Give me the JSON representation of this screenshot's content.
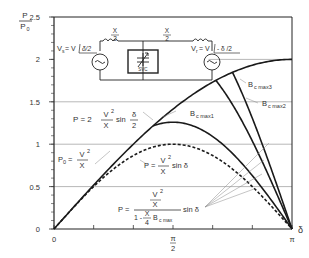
{
  "chart_data": {
    "type": "line",
    "title": "",
    "xlabel": "δ",
    "ylabel": "P / P0",
    "ylabel_num": "P",
    "ylabel_den": "P0",
    "xlim": [
      0,
      3.14159
    ],
    "ylim": [
      0,
      2.5
    ],
    "x_ticks": [
      {
        "value": 0,
        "label": "0"
      },
      {
        "value": 0.5236,
        "label": ""
      },
      {
        "value": 1.0472,
        "label": ""
      },
      {
        "value": 1.5708,
        "label_num": "π",
        "label_den": "2"
      },
      {
        "value": 2.0944,
        "label": ""
      },
      {
        "value": 2.618,
        "label": ""
      },
      {
        "value": 3.14159,
        "label": "π"
      }
    ],
    "y_ticks": [
      {
        "value": 0,
        "label": "0"
      },
      {
        "value": 0.5,
        "label": "0.5"
      },
      {
        "value": 1,
        "label": "1"
      },
      {
        "value": 1.5,
        "label": "1.5"
      },
      {
        "value": 2,
        "label": "2"
      },
      {
        "value": 2.5,
        "label": "2.5"
      }
    ],
    "y_minor_step": 0.1,
    "grid_y": [
      0.5,
      1,
      1.5
    ],
    "grid_y_partial": {
      "value": 2,
      "x_start": 2.04
    },
    "series": [
      {
        "name": "P = 2 V²/X sin δ/2 (ideal midpoint compensation)",
        "style": "solid",
        "formula": "2sin(d/2)",
        "x": [
          0,
          0.5236,
          1.0472,
          1.5708,
          2.0944,
          2.618,
          3.14159
        ],
        "values": [
          0,
          0.52,
          1.0,
          1.41,
          1.73,
          1.93,
          2.0
        ]
      },
      {
        "name": "P = V²/X sin δ (uncompensated)",
        "style": "dashed",
        "formula": "sin(d)",
        "x": [
          0,
          0.5236,
          1.0472,
          1.5708,
          2.0944,
          2.618,
          3.14159
        ],
        "values": [
          0,
          0.5,
          0.87,
          1.0,
          0.87,
          0.5,
          0
        ]
      },
      {
        "name": "Bc max1",
        "style": "solid",
        "branch_delta": 1.307,
        "values_peak": 1.26
      },
      {
        "name": "Bc max2",
        "style": "solid",
        "branch_delta": 2.136,
        "values_peak": 1.75
      },
      {
        "name": "Bc max3",
        "style": "solid",
        "branch_delta": 2.356,
        "values_peak": 1.85
      }
    ],
    "annotations": {
      "p_midpoint": {
        "lhs": "P =  2",
        "num": "V",
        "sup": "2",
        "den": "X",
        "fn": "sin",
        "arg_num": "δ",
        "arg_den": "2"
      },
      "p0": {
        "lhs": "P",
        "sub": "0",
        "eq": "=",
        "num": "V",
        "sup": "2",
        "den": "X"
      },
      "p_uncomp": {
        "lhs": "P =",
        "num": "V",
        "sup": "2",
        "den": "X",
        "fn": "sin δ"
      },
      "p_comp": {
        "lhs": "P =",
        "num_num": "V",
        "num_sup": "2",
        "num_den": "X",
        "den_prefix": "1 -",
        "den_frac_num": "X",
        "den_frac_den": "4",
        "den_suffix": "B",
        "den_sub": "c max",
        "fn": "sin δ"
      },
      "bcmax1": {
        "main": "B",
        "sub": "c max1"
      },
      "bcmax2": {
        "main": "B",
        "sub": "c max2"
      },
      "bcmax3": {
        "main": "B",
        "sub": "c max3"
      }
    },
    "circuit": {
      "vs_label": "V",
      "vs_sub": "s",
      "vs_eq": "= V",
      "vs_angle": "δ/2",
      "vr_label": "V",
      "vr_sub": "r",
      "vr_eq": "= V",
      "vr_angle": "- δ /2",
      "x_half_num": "X",
      "x_half_den": "2",
      "svc_label": "SVC"
    },
    "colors": {
      "curve": "#1a1a1a",
      "grid": "#9a9a9a",
      "axis": "#222222",
      "text": "#333333",
      "leader": "#8a8a8a"
    }
  }
}
